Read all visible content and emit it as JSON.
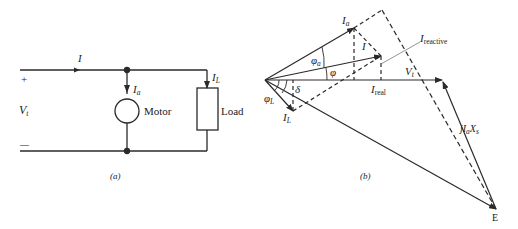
{
  "figure_a": {
    "caption": "(a)",
    "plus_sign": "+",
    "minus_sign": "—",
    "terminal_voltage": {
      "symbol": "V",
      "sub": "t"
    },
    "line_current": {
      "symbol": "I"
    },
    "motor_current": {
      "symbol": "I",
      "sub": "a"
    },
    "load_current": {
      "symbol": "I",
      "sub": "L"
    },
    "motor_label": "Motor",
    "load_label": "Load"
  },
  "figure_b": {
    "caption": "(b)",
    "phasors": {
      "Ia": {
        "symbol": "I",
        "sub": "a"
      },
      "I": {
        "symbol": "I"
      },
      "Vt": {
        "symbol": "V",
        "sub": "t"
      },
      "IL": {
        "symbol": "I",
        "sub": "L"
      },
      "I_reactive": {
        "symbol": "I",
        "sub": "reactive"
      },
      "I_real": {
        "symbol": "I",
        "sub": "real"
      },
      "jIaXs": {
        "prefix": "jI",
        "sub": "a",
        "suffix": "X",
        "sub2": "s"
      },
      "E": {
        "symbol": "E"
      }
    },
    "angles": {
      "phi_a": {
        "symbol": "φ",
        "sub": "a"
      },
      "phi": {
        "symbol": "φ"
      },
      "delta": {
        "symbol": "δ"
      },
      "phi_L": {
        "symbol": "φ",
        "sub": "L"
      }
    }
  },
  "colors": {
    "stroke": "#2a2a2a",
    "background": "#ffffff"
  }
}
